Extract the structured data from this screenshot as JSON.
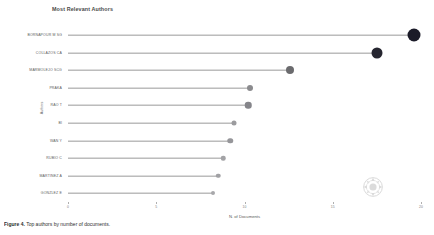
{
  "chart_data": {
    "type": "bar",
    "title": "Most Relevant Authors",
    "xlabel": "N. of Documents",
    "ylabel": "Authors",
    "xlim": [
      0,
      20
    ],
    "xticks": [
      0,
      5,
      10,
      15,
      20
    ],
    "xticklabels": [
      "0",
      "5",
      "10",
      "15",
      "20"
    ],
    "grid": false,
    "legend": null,
    "categories": [
      "BORNAPOUR M SG",
      "COLLAZOS CA",
      "MARMOLEJO SCG",
      "PRAKA",
      "RAO T",
      "BI",
      "WAN Y",
      "RUBIO C",
      "MARTINEZ A",
      "GONZLEZ E"
    ],
    "values": [
      19.6,
      17.5,
      12.6,
      10.3,
      10.2,
      9.4,
      9.2,
      8.8,
      8.5,
      8.2
    ],
    "marker_sizes": [
      13,
      11,
      8,
      6,
      6.5,
      5,
      5.5,
      4.5,
      4.5,
      4
    ],
    "marker_colors": [
      "#1b1b28",
      "#262630",
      "#6b6b6e",
      "#8b8b8e",
      "#85858a",
      "#9b9b9e",
      "#96969a",
      "#a3a3a6",
      "#a1a1a4",
      "#a8a8ab"
    ]
  },
  "chart": {
    "title": "Most Relevant Authors",
    "x_axis_label": "N. of Documents",
    "y_axis_label": "Authors"
  },
  "watermark": {
    "name": "circular-logo-watermark"
  },
  "caption": {
    "label": "Figure 4.",
    "text": "Top authors by number of documents."
  }
}
